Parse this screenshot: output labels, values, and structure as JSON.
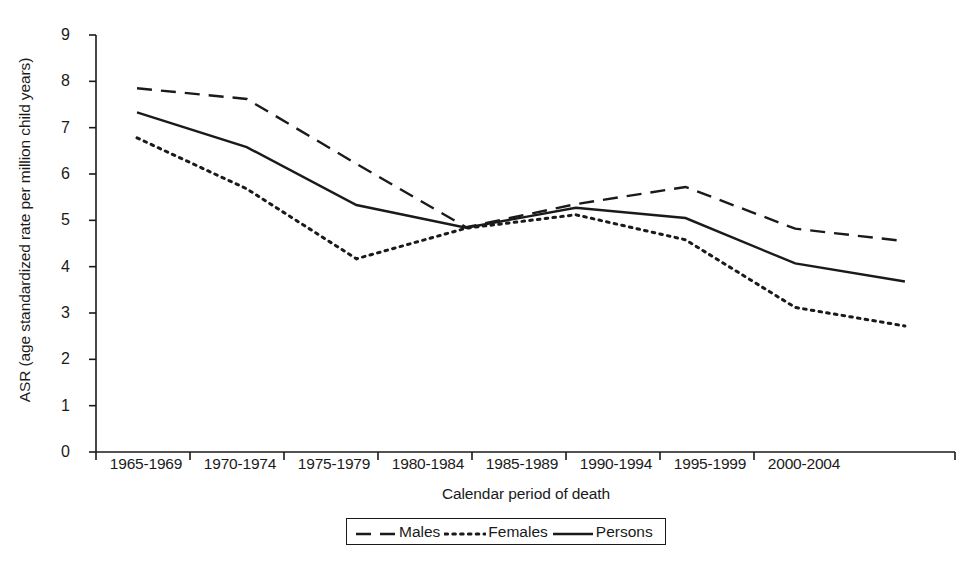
{
  "chart_data": {
    "type": "line",
    "title": "",
    "xlabel": "Calendar period of death",
    "ylabel": "ASR (age standardized rate per million child years)",
    "categories": [
      "1965-1969",
      "1970-1974",
      "1975-1979",
      "1980-1984",
      "1985-1989",
      "1990-1994",
      "1995-1999",
      "2000-2004"
    ],
    "ylim": [
      0,
      9
    ],
    "yticks": [
      0,
      1,
      2,
      3,
      4,
      5,
      6,
      7,
      8,
      9
    ],
    "ytick_labels": [
      "0",
      "1",
      "2",
      "3",
      "4",
      "5",
      "6",
      "7",
      "8",
      "9"
    ],
    "grid": false,
    "legend_position": "bottom-center",
    "series": [
      {
        "name": "Males",
        "style": "dashed",
        "color": "#1a1a1a",
        "values": [
          7.85,
          7.62,
          6.22,
          4.85,
          5.35,
          5.72,
          4.82,
          4.55
        ]
      },
      {
        "name": "Females",
        "style": "dotted",
        "color": "#1a1a1a",
        "values": [
          6.78,
          5.68,
          4.17,
          4.83,
          5.12,
          4.58,
          3.12,
          2.72
        ]
      },
      {
        "name": "Persons",
        "style": "solid",
        "color": "#1a1a1a",
        "values": [
          7.33,
          6.58,
          5.33,
          4.84,
          5.27,
          5.05,
          4.07,
          3.68
        ]
      }
    ]
  },
  "legend": {
    "items": [
      {
        "label": "Males",
        "style": "dashed"
      },
      {
        "label": "Females",
        "style": "dotted"
      },
      {
        "label": "Persons",
        "style": "solid"
      }
    ]
  }
}
